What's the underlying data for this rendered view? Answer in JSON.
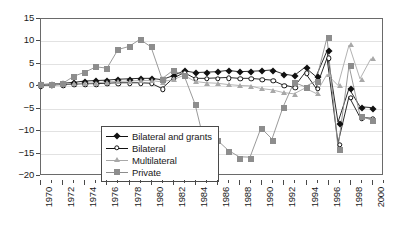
{
  "chart_data": {
    "type": "line",
    "title": "",
    "xlabel": "",
    "ylabel": "",
    "xlim": [
      1970,
      2001
    ],
    "ylim": [
      -20,
      15
    ],
    "yticks": [
      15,
      10,
      5,
      0,
      -5,
      -10,
      -15,
      -20
    ],
    "ytick_labels": [
      "15",
      "10",
      "5",
      "0",
      "−5",
      "−10",
      "−15",
      "−20"
    ],
    "xticks": [
      1970,
      1971,
      1972,
      1973,
      1974,
      1975,
      1976,
      1977,
      1978,
      1979,
      1980,
      1981,
      1982,
      1983,
      1984,
      1985,
      1986,
      1987,
      1988,
      1989,
      1990,
      1991,
      1992,
      1993,
      1994,
      1995,
      1996,
      1997,
      1998,
      1999,
      2000,
      2001
    ],
    "xtick_labels": [
      "1970",
      "1972",
      "1974",
      "1976",
      "1978",
      "1980",
      "1982",
      "1984",
      "1986",
      "1988",
      "1990",
      "1992",
      "1994",
      "1996",
      "1998",
      "2000"
    ],
    "xtick_label_years": [
      1970,
      1972,
      1974,
      1976,
      1978,
      1980,
      1982,
      1984,
      1986,
      1988,
      1990,
      1992,
      1994,
      1996,
      1998,
      2000
    ],
    "grid": true,
    "grid_axis": "y",
    "legend_position": "lower-left-inside",
    "x": [
      1970,
      1971,
      1972,
      1973,
      1974,
      1975,
      1976,
      1977,
      1978,
      1979,
      1980,
      1981,
      1982,
      1983,
      1984,
      1985,
      1986,
      1987,
      1988,
      1989,
      1990,
      1991,
      1992,
      1993,
      1994,
      1995,
      1996,
      1997,
      1998,
      1999,
      2000
    ],
    "series": [
      {
        "name": "Bilateral and grants",
        "marker": "filled-diamond",
        "color": "#111111",
        "values": [
          0.2,
          0.3,
          0.5,
          0.7,
          1.0,
          1.1,
          1.2,
          1.4,
          1.5,
          1.6,
          1.6,
          1.3,
          2.2,
          3.3,
          2.9,
          3.0,
          3.1,
          3.4,
          3.1,
          3.2,
          3.3,
          3.5,
          2.6,
          2.2,
          4.1,
          2.0,
          7.8,
          -8.3,
          -0.7,
          -4.8,
          -5.0
        ]
      },
      {
        "name": "Bilateral",
        "marker": "open-circle",
        "color": "#111111",
        "values": [
          0.0,
          0.1,
          0.2,
          0.3,
          0.4,
          0.4,
          0.5,
          0.6,
          0.6,
          0.6,
          0.5,
          -0.7,
          1.6,
          2.9,
          1.6,
          1.6,
          1.7,
          1.8,
          1.6,
          1.6,
          1.4,
          1.2,
          0.1,
          -0.4,
          2.9,
          -0.6,
          6.2,
          -13.0,
          -2.5,
          -7.2,
          -7.4
        ]
      },
      {
        "name": "Multilateral",
        "marker": "triangle",
        "color": "#a8a8a8",
        "values": [
          0.1,
          0.2,
          0.3,
          0.4,
          0.5,
          0.6,
          0.8,
          0.9,
          1.0,
          1.1,
          1.1,
          0.8,
          1.3,
          2.3,
          0.9,
          0.6,
          0.5,
          0.2,
          0.0,
          -0.1,
          -0.7,
          -1.0,
          -1.6,
          -1.9,
          -0.6,
          -1.8,
          2.5,
          0.0,
          9.1,
          1.5,
          6.1
        ]
      },
      {
        "name": "Private",
        "marker": "filled-square",
        "color": "#8d8d8d",
        "values": [
          0.2,
          0.3,
          0.5,
          2.1,
          3.0,
          4.2,
          3.9,
          8.1,
          8.8,
          10.4,
          8.7,
          1.5,
          3.4,
          2.3,
          -4.2,
          -14.4,
          -12.3,
          -14.6,
          -16.1,
          -16.2,
          -9.6,
          -12.1,
          -4.9,
          0.7,
          -0.3,
          1.0,
          10.8,
          -14.1,
          4.5,
          -6.8,
          -7.8
        ]
      }
    ]
  },
  "legend": {
    "items": [
      {
        "label": "Bilateral and grants",
        "marker": "filled-diamond"
      },
      {
        "label": "Bilateral",
        "marker": "open-circle"
      },
      {
        "label": "Multilateral",
        "marker": "triangle"
      },
      {
        "label": "Private",
        "marker": "filled-square"
      }
    ]
  },
  "colors": {
    "axis": "#6a6a6a",
    "grid": "#e2e2e2",
    "background": "#ffffff",
    "dark_series": "#111111",
    "mid_gray_series": "#8d8d8d",
    "light_gray_series": "#a8a8a8"
  }
}
